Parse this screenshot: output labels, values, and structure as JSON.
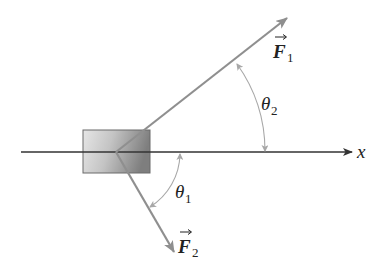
{
  "diagram": {
    "axis": {
      "label": "x"
    },
    "forces": [
      {
        "name": "F",
        "subscript": "1",
        "label": "F1",
        "direction": "up-right"
      },
      {
        "name": "F",
        "subscript": "2",
        "label": "F2",
        "direction": "down-right"
      }
    ],
    "angles": [
      {
        "symbol": "θ",
        "subscript": "2",
        "label": "θ2",
        "between": "x-axis and F1"
      },
      {
        "symbol": "θ",
        "subscript": "1",
        "label": "θ1",
        "between": "x-axis and F2"
      }
    ],
    "colors": {
      "axis": "#333333",
      "force_arrow": "#8f8f8f",
      "angle_arc": "#a8a8a8",
      "block_light": "#e4e4e4",
      "block_dark": "#8a8a8a",
      "text": "#222222"
    }
  }
}
